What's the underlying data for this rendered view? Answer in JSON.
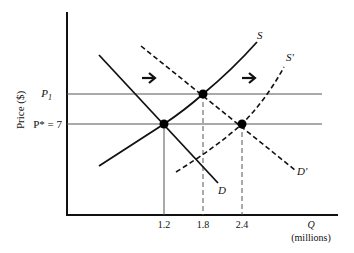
{
  "diagram": {
    "type": "supply-demand",
    "y_axis_label": "Price ($)",
    "x_axis_label": "Q",
    "x_axis_unit": "(millions)",
    "price_levels": [
      {
        "id": "p1",
        "label_main": "P",
        "label_sub": "1"
      },
      {
        "id": "pstar",
        "label": "P* = 7"
      }
    ],
    "x_ticks": [
      "1.2",
      "1.8",
      "2.4"
    ],
    "curves": {
      "supply": "S",
      "supply_shifted": "S'",
      "demand": "D",
      "demand_shifted": "D'"
    },
    "equilibria": [
      {
        "q": "1.2",
        "price": "P* = 7"
      },
      {
        "q": "1.8",
        "price": "P1"
      },
      {
        "q": "2.4",
        "price": "P* = 7"
      }
    ],
    "arrows": [
      "right",
      "right"
    ],
    "colors": {
      "ink": "#111111",
      "guide": "#555555",
      "background": "#ffffff"
    }
  }
}
